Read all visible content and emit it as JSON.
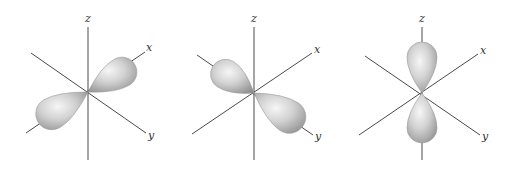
{
  "figure": {
    "colors": {
      "background": "#ffffff",
      "axis": "#4a4a4a",
      "label": "#333333",
      "lobe_light": "#f4f4f4",
      "lobe_mid": "#c8c8c8",
      "lobe_dark": "#8e8e8e"
    },
    "panels": [
      {
        "id": "px",
        "orbital": "p_x",
        "center": [
          88,
          92
        ],
        "axes": {
          "x": {
            "label": "x",
            "from": [
              26,
              133
            ],
            "to": [
              145,
              52
            ],
            "label_pos": [
              146,
              51
            ]
          },
          "y": {
            "label": "y",
            "from": [
              31,
              53
            ],
            "to": [
              146,
              133
            ],
            "label_pos": [
              148,
              139
            ]
          },
          "z": {
            "label": "z",
            "from": [
              88,
              27
            ],
            "to": [
              88,
              160
            ],
            "label_pos": [
              85,
              22
            ]
          }
        },
        "lobes": [
          {
            "tip": [
              88,
              92
            ],
            "end": [
              134,
              65
            ],
            "width": 30
          },
          {
            "tip": [
              88,
              92
            ],
            "end": [
              38,
              122
            ],
            "width": 32
          }
        ]
      },
      {
        "id": "py",
        "orbital": "p_y",
        "center": [
          254,
          93
        ],
        "axes": {
          "x": {
            "label": "x",
            "from": [
              192,
              134
            ],
            "to": [
              312,
              53
            ],
            "label_pos": [
              314,
              53
            ]
          },
          "y": {
            "label": "y",
            "from": [
              197,
              55
            ],
            "to": [
              313,
              135
            ],
            "label_pos": [
              315,
              140
            ]
          },
          "z": {
            "label": "z",
            "from": [
              254,
              27
            ],
            "to": [
              254,
              160
            ],
            "label_pos": [
              251,
              22
            ]
          }
        },
        "lobes": [
          {
            "tip": [
              254,
              93
            ],
            "end": [
              213,
              66
            ],
            "width": 30
          },
          {
            "tip": [
              254,
              93
            ],
            "end": [
              303,
              126
            ],
            "width": 33
          }
        ]
      },
      {
        "id": "pz",
        "orbital": "p_z",
        "center": [
          422,
          93
        ],
        "axes": {
          "x": {
            "label": "x",
            "from": [
              359,
              135
            ],
            "to": [
              478,
              54
            ],
            "label_pos": [
              480,
              54
            ]
          },
          "y": {
            "label": "y",
            "from": [
              365,
              56
            ],
            "to": [
              480,
              135
            ],
            "label_pos": [
              482,
              140
            ]
          },
          "z": {
            "label": "z",
            "from": [
              422,
              27
            ],
            "to": [
              422,
              160
            ],
            "label_pos": [
              419,
              22
            ]
          }
        },
        "lobes": [
          {
            "tip": [
              422,
              93
            ],
            "end": [
              422,
              42
            ],
            "width": 30
          },
          {
            "tip": [
              422,
              93
            ],
            "end": [
              422,
              143
            ],
            "width": 30
          }
        ]
      }
    ]
  }
}
